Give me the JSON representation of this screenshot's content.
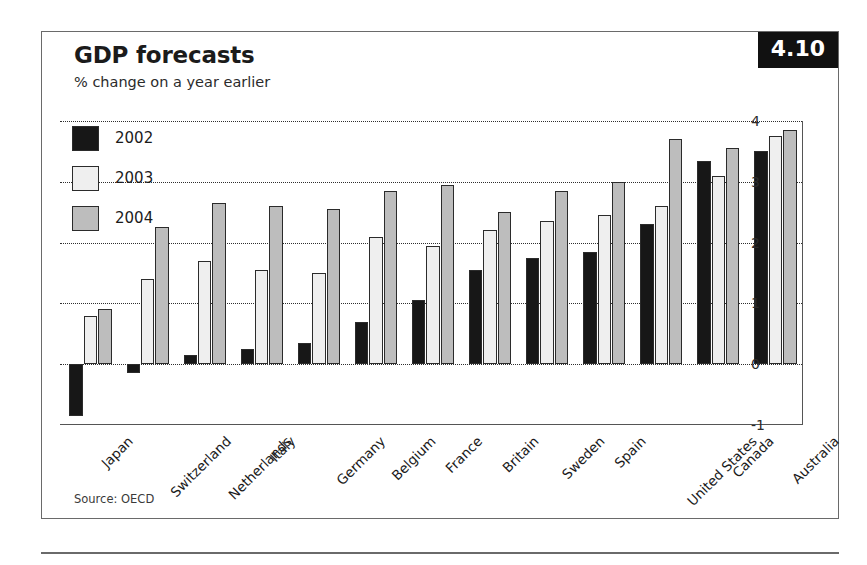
{
  "header": {
    "title": "GDP forecasts",
    "subtitle": "% change on a year earlier",
    "badge": "4.10"
  },
  "footer": {
    "source": "Source: OECD"
  },
  "chart_data": {
    "type": "bar",
    "title": "GDP forecasts",
    "subtitle": "% change on a year earlier",
    "xlabel": "",
    "ylabel": "% change on a year earlier",
    "ylim": [
      -1,
      4
    ],
    "yticks": [
      4,
      3,
      2,
      1,
      0,
      -1
    ],
    "ytick_labels": [
      "4",
      "3",
      "2",
      "1",
      "0",
      "-1"
    ],
    "grid": true,
    "grid_style": "dotted-horizontal",
    "axis_position": "right",
    "legend_position": "top-left",
    "orientation": "vertical-grouped",
    "categories": [
      "Japan",
      "Switzerland",
      "Netherlands",
      "Italy",
      "Germany",
      "Belgium",
      "France",
      "Britain",
      "Sweden",
      "Spain",
      "United States",
      "Canada",
      "Australia"
    ],
    "series": [
      {
        "name": "2002",
        "color": "#171717",
        "values": [
          -0.85,
          -0.15,
          0.15,
          0.25,
          0.35,
          0.7,
          1.05,
          1.55,
          1.75,
          1.85,
          2.3,
          3.35,
          3.5
        ]
      },
      {
        "name": "2003",
        "color": "#efefef",
        "values": [
          0.8,
          1.4,
          1.7,
          1.55,
          1.5,
          2.1,
          1.95,
          2.2,
          2.35,
          2.45,
          2.6,
          3.1,
          3.75
        ]
      },
      {
        "name": "2004",
        "color": "#bdbdbd",
        "values": [
          0.9,
          2.25,
          2.65,
          2.6,
          2.55,
          2.85,
          2.95,
          2.5,
          2.85,
          3.0,
          3.7,
          3.55,
          3.85
        ]
      }
    ]
  }
}
